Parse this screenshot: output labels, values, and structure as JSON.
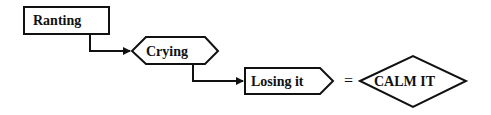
{
  "diagram": {
    "nodes": [
      {
        "id": "ranting",
        "label": "Ranting",
        "shape": "rectangle"
      },
      {
        "id": "crying",
        "label": "Crying",
        "shape": "hexagon"
      },
      {
        "id": "losing",
        "label": "Losing it",
        "shape": "pentagon-arrow"
      },
      {
        "id": "calm",
        "label": "CALM IT",
        "shape": "diamond"
      }
    ],
    "edges": [
      {
        "from": "ranting",
        "to": "crying"
      },
      {
        "from": "crying",
        "to": "losing"
      }
    ],
    "equals_sign": "=",
    "colors": {
      "stroke": "#111111",
      "fill": "#ffffff"
    }
  }
}
